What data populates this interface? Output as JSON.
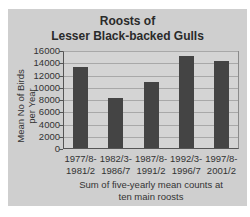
{
  "chart_data": {
    "type": "bar",
    "title": "Roosts of Lesser Black-backed Gulls",
    "title_lines": [
      "Roosts of",
      "Lesser Black-backed Gulls"
    ],
    "categories": [
      "1977/8-1981/2",
      "1982/3-1986/7",
      "1987/8-1991/2",
      "1992/3-1996/7",
      "1997/8-2001/2"
    ],
    "category_lines": [
      [
        "1977/8-",
        "1981/2"
      ],
      [
        "1982/3-",
        "1986/7"
      ],
      [
        "1987/8-",
        "1991/2"
      ],
      [
        "1992/3-",
        "1996/7"
      ],
      [
        "1997/8-",
        "2001/2"
      ]
    ],
    "values": [
      13300,
      8100,
      10700,
      15000,
      14200
    ],
    "xlabel": "Sum of five-yearly mean counts at ten main roosts",
    "xlabel_lines": [
      "Sum of five-yearly mean counts at",
      "ten main roosts"
    ],
    "ylabel": "Mean No of Birds per Year",
    "ylabel_lines": [
      "Mean No of Birds",
      "per Year"
    ],
    "ylim": [
      0,
      16000
    ],
    "yticks": [
      0,
      2000,
      4000,
      6000,
      8000,
      10000,
      12000,
      14000,
      16000
    ],
    "grid": true,
    "legend": null,
    "colors": {
      "bar": "#444444",
      "background": "#cfcfcf",
      "gridline": "#a8a8a8"
    }
  }
}
